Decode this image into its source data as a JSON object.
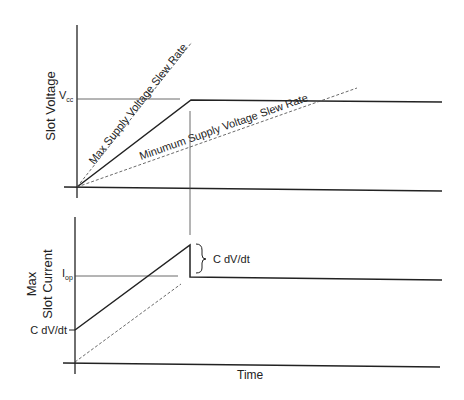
{
  "diagram": {
    "top_plot": {
      "ylabel": "Slot Voltage",
      "vcc_label": "V",
      "vcc_sub": "cc",
      "max_slew_label": "Max Supply Voltage Slew Rate",
      "min_slew_label": "Minumum Supply Voltage Slew Rate"
    },
    "bottom_plot": {
      "ylabel_line1": "Max",
      "ylabel_line2": "Slot Current",
      "iop_label": "I",
      "iop_sub": "op",
      "cdvdt_axis_label": "C dV/dt",
      "brace_label": "C dV/dt",
      "xlabel": "Time"
    },
    "colors": {
      "line": "#222222",
      "dashed": "#444444",
      "background": "#ffffff"
    }
  }
}
